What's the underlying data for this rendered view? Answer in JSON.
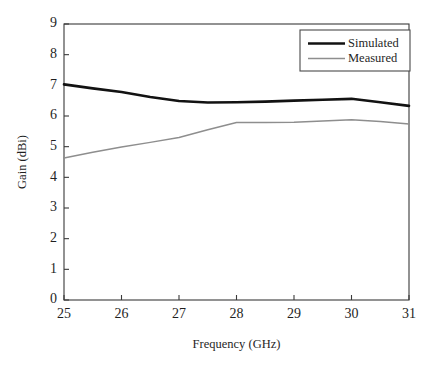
{
  "chart_data": {
    "type": "line",
    "title": "",
    "subtitle": "",
    "xlabel": "Frequency (GHz)",
    "ylabel": "Gain (dBi)",
    "xlim": [
      25,
      31
    ],
    "ylim": [
      0,
      9
    ],
    "xticks": [
      25,
      26,
      27,
      28,
      29,
      30,
      31
    ],
    "yticks": [
      0,
      1,
      2,
      3,
      4,
      5,
      6,
      7,
      8,
      9
    ],
    "xtick_labels": [
      "25",
      "26",
      "27",
      "28",
      "29",
      "30",
      "31"
    ],
    "ytick_labels": [
      "0",
      "1",
      "2",
      "3",
      "4",
      "5",
      "6",
      "7",
      "8",
      "9"
    ],
    "grid": false,
    "legend_position": "top-right",
    "x": [
      25.0,
      25.5,
      26.0,
      26.5,
      27.0,
      27.5,
      28.0,
      28.5,
      29.0,
      29.5,
      30.0,
      30.5,
      31.0
    ],
    "series": [
      {
        "name": "Simulated",
        "color": "#121212",
        "width": 2.6,
        "values": [
          7.03,
          6.9,
          6.78,
          6.62,
          6.49,
          6.44,
          6.45,
          6.47,
          6.5,
          6.53,
          6.56,
          6.45,
          6.33
        ]
      },
      {
        "name": "Measured",
        "color": "#8e8e8e",
        "width": 1.5,
        "values": [
          4.63,
          4.82,
          4.99,
          5.14,
          5.3,
          5.55,
          5.79,
          5.79,
          5.8,
          5.84,
          5.88,
          5.82,
          5.74
        ]
      }
    ]
  },
  "legend": {
    "entries": [
      {
        "label": "Simulated"
      },
      {
        "label": "Measured"
      }
    ]
  },
  "axes": {
    "x_title": "Frequency (GHz)",
    "y_title": "Gain (dBi)"
  },
  "colors": {
    "simulated": "#121212",
    "measured": "#8e8e8e",
    "axis": "#3a3a3a",
    "background": "#ffffff"
  }
}
